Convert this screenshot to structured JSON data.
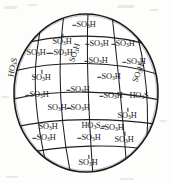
{
  "figure": {
    "kind": "sulfonated-sphere-diagram",
    "caption": "",
    "sphere": {
      "cx": 86,
      "cy": 93,
      "rx": 72,
      "ry": 79,
      "stroke_color": "#1b1b1b",
      "fill_color": "#ffffff"
    },
    "background_color": "#fdfdfb"
  },
  "groups": [
    {
      "id": "g01",
      "text": "SO₃H",
      "html": "SO<sub>3</sub>H",
      "x": 86,
      "y": 25,
      "rot": 0,
      "tick": "tick-left"
    },
    {
      "id": "g02",
      "text": "SO₃H",
      "html": "SO<sub>3</sub>H",
      "x": 62,
      "y": 42,
      "rot": 0,
      "tick": "tick-up"
    },
    {
      "id": "g03",
      "text": "SO₃H",
      "html": "SO<sub>3</sub>H",
      "x": 99,
      "y": 44,
      "rot": 0,
      "tick": "tick-left"
    },
    {
      "id": "g04",
      "text": "SO₃H",
      "html": "SO<sub>3</sub>H",
      "x": 125,
      "y": 44,
      "rot": 0,
      "tick": "tick-left"
    },
    {
      "id": "g05",
      "text": "SO₃H",
      "html": "SO<sub>3</sub>H",
      "x": 36,
      "y": 53,
      "rot": 0,
      "tick": "tick-right"
    },
    {
      "id": "g06",
      "text": "SO₃H",
      "html": "SO<sub>3</sub>H",
      "x": 63,
      "y": 53,
      "rot": 0,
      "tick": "tick-left"
    },
    {
      "id": "g07",
      "text": "SO₃H",
      "html": "SO<sub>3</sub>H",
      "x": 82,
      "y": 62,
      "rot": -72,
      "tick": "none"
    },
    {
      "id": "g08",
      "text": "SO₃H",
      "html": "SO<sub>3</sub>H",
      "x": 98,
      "y": 61,
      "rot": 0,
      "tick": "tick-left"
    },
    {
      "id": "g09",
      "text": "SO₃H",
      "html": "SO<sub>3</sub>H",
      "x": 136,
      "y": 62,
      "rot": 0,
      "tick": "tick-left"
    },
    {
      "id": "g10",
      "text": "HO₃S",
      "html": "HO<sub>3</sub>S",
      "x": 21,
      "y": 77,
      "rot": -78,
      "tick": "none"
    },
    {
      "id": "g11",
      "text": "SO₃H",
      "html": "SO<sub>3</sub>H",
      "x": 41,
      "y": 78,
      "rot": 0,
      "tick": "tick-up"
    },
    {
      "id": "g12",
      "text": "SO₃H",
      "html": "SO<sub>3</sub>H",
      "x": 111,
      "y": 77,
      "rot": 0,
      "tick": "tick-left"
    },
    {
      "id": "g13",
      "text": "SO₃H",
      "html": "SO<sub>3</sub>H",
      "x": 145,
      "y": 82,
      "rot": -68,
      "tick": "none"
    },
    {
      "id": "g14",
      "text": "SO₃H",
      "html": "SO<sub>3</sub>H",
      "x": 39,
      "y": 95,
      "rot": 0,
      "tick": "tick-left"
    },
    {
      "id": "g15",
      "text": "SO₃H",
      "html": "SO<sub>3</sub>H",
      "x": 80,
      "y": 90,
      "rot": 0,
      "tick": "tick-left"
    },
    {
      "id": "g16",
      "text": "SO₃H",
      "html": "SO<sub>3</sub>H",
      "x": 113,
      "y": 96,
      "rot": 0,
      "tick": "tick-left"
    },
    {
      "id": "g17",
      "text": "HO₃S",
      "html": "HO<sub>3</sub>S",
      "x": 139,
      "y": 96,
      "rot": 0,
      "tick": "none"
    },
    {
      "id": "g18",
      "text": "SO₃H",
      "html": "SO<sub>3</sub>H",
      "x": 57,
      "y": 108,
      "rot": 0,
      "tick": "tick-right"
    },
    {
      "id": "g19",
      "text": "SO₃H",
      "html": "SO<sub>3</sub>H",
      "x": 80,
      "y": 108,
      "rot": 0,
      "tick": "tick-left"
    },
    {
      "id": "g20",
      "text": "SO₃H",
      "html": "SO<sub>3</sub>H",
      "x": 127,
      "y": 116,
      "rot": 0,
      "tick": "tick-up"
    },
    {
      "id": "g21",
      "text": "SO₃H",
      "html": "SO<sub>3</sub>H",
      "x": 48,
      "y": 127,
      "rot": 0,
      "tick": "none"
    },
    {
      "id": "g22",
      "text": "HO₃S",
      "html": "HO<sub>3</sub>S",
      "x": 91,
      "y": 126,
      "rot": 0,
      "tick": "tick-right"
    },
    {
      "id": "g23",
      "text": "SO₃H",
      "html": "SO<sub>3</sub>H",
      "x": 114,
      "y": 128,
      "rot": 0,
      "tick": "tick-left"
    },
    {
      "id": "g24",
      "text": "SO₃H",
      "html": "SO<sub>3</sub>H",
      "x": 46,
      "y": 138,
      "rot": 0,
      "tick": "tick-left"
    },
    {
      "id": "g25",
      "text": "SO₃H",
      "html": "SO<sub>3</sub>H",
      "x": 91,
      "y": 138,
      "rot": 0,
      "tick": "tick-left"
    },
    {
      "id": "g26",
      "text": "SO₃H",
      "html": "SO<sub>3</sub>H",
      "x": 124,
      "y": 140,
      "rot": 0,
      "tick": "tick-up"
    },
    {
      "id": "g27",
      "text": "SO₃H",
      "html": "SO<sub>3</sub>H",
      "x": 88,
      "y": 163,
      "rot": 0,
      "tick": "tick-up"
    }
  ],
  "grid": {
    "meridians": [
      "M 43 26 C 33 58, 31 100, 47 160",
      "M 63 19 C 58 58, 58 112, 70 172",
      "M 86 16 C 86 60, 88 120, 92 172",
      "M 112 20 C 116 60, 122 115, 126 165",
      "M 136 32 C 146 62, 150 110, 146 146"
    ],
    "parallels": [
      "M 27 45 C 60 33, 112 31, 150 50",
      "M 17 71 C 55 60, 120 60, 157 76",
      "M 15 100 C 52 88, 120 90, 157 100",
      "M 20 127 C 58 116, 120 118, 153 124",
      "M 36 154 C 68 144, 118 144, 145 150"
    ]
  }
}
